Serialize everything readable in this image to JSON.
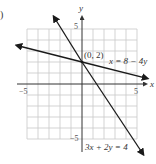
{
  "problem_label": ")",
  "axes": {
    "x_label": "x",
    "y_label": "y",
    "x_min_label": "−5",
    "x_max_label": "5",
    "y_max_label": "5",
    "y_min_label": "−5",
    "grid_range": [
      -5,
      5
    ],
    "grid_step": 1
  },
  "lines": [
    {
      "equation": "x = 8 − 4y",
      "slope": -0.25,
      "intercept": 2,
      "color": "#1a1a1a"
    },
    {
      "equation": "3x + 2y = 4",
      "slope": -1.5,
      "intercept": 2,
      "color": "#1a1a1a"
    }
  ],
  "intersection": {
    "label": "(0, 2)",
    "x": 0,
    "y": 2
  },
  "colors": {
    "grid": "#c8c8c8",
    "axis": "#333333",
    "line": "#1a1a1a"
  }
}
